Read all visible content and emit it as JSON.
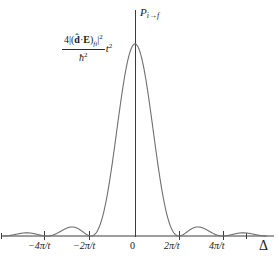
{
  "figure": {
    "background_color": "#ffffff",
    "curve_color": "#6f6f6f",
    "axis_color": "#3c3c3c",
    "text_color": "#1a1a1a"
  },
  "labels": {
    "y_axis": "P",
    "y_axis_sub": "i→f",
    "x_axis": "Δ",
    "peak_value": {
      "numerator_prefix": "4|(",
      "numerator_dhat": "d̂",
      "numerator_dot": "·",
      "numerator_E": "E",
      "numerator_close": ")",
      "numerator_sub": "fi",
      "numerator_bar": "|",
      "numerator_sup": "2",
      "denominator": "ħ",
      "denominator_sup": "2",
      "t_factor": "t",
      "t_sup": "2"
    }
  },
  "caption_fragment": "",
  "chart_data": {
    "type": "line",
    "title": "",
    "xlabel": "Δ",
    "ylabel": "P_{i→f}",
    "peak_label": "4|(d̂·E)_fi|² / ħ² · t²",
    "xlim": [
      -6.283185,
      6.283185
    ],
    "ylim": [
      0,
      1.05
    ],
    "grid": false,
    "legend": null,
    "function": "sinc^2(Δ t / 2)",
    "xtick_values": [
      -4.18879,
      -2.094395,
      0,
      2.094395,
      4.18879
    ],
    "xtick_labels": [
      "−4π/t",
      "−2π/t",
      "0",
      "2π/t",
      "4π/t"
    ],
    "tick_pixel_x": [
      44,
      89,
      135,
      179,
      223
    ],
    "axis_pixel_y": 236,
    "peak_pixel": [
      135,
      44
    ],
    "zeros_at": [
      "±2π/t",
      "±4π/t",
      "±6π/t"
    ],
    "sidelobe_peaks": [
      0.047,
      0.047,
      0.017,
      0.017
    ],
    "x": [
      -6.2832,
      -6.0,
      -5.7,
      -5.4,
      -5.1,
      -4.8,
      -4.5,
      -4.1888,
      -3.9,
      -3.6,
      -3.3,
      -3.1416,
      -2.9,
      -2.6,
      -2.3,
      -2.0944,
      -1.8,
      -1.5,
      -1.2,
      -0.9,
      -0.6,
      -0.3,
      0.0,
      0.3,
      0.6,
      0.9,
      1.2,
      1.5,
      1.8,
      2.0944,
      2.3,
      2.6,
      2.9,
      3.1416,
      3.3,
      3.6,
      3.9,
      4.1888,
      4.5,
      4.8,
      5.1,
      5.4,
      5.7,
      6.0,
      6.2832
    ],
    "y": [
      0.0,
      0.0055,
      0.0137,
      0.0165,
      0.0125,
      0.0053,
      0.0005,
      0.0,
      0.0042,
      0.0168,
      0.0327,
      0.0405,
      0.0444,
      0.0356,
      0.0107,
      0.0,
      0.0384,
      0.1468,
      0.3228,
      0.5275,
      0.7263,
      0.9067,
      1.0,
      0.9067,
      0.7263,
      0.5275,
      0.3228,
      0.1468,
      0.0384,
      0.0,
      0.0107,
      0.0356,
      0.0444,
      0.0405,
      0.0327,
      0.0168,
      0.0042,
      0.0,
      0.0005,
      0.0053,
      0.0125,
      0.0165,
      0.0137,
      0.0055,
      0.0
    ]
  }
}
